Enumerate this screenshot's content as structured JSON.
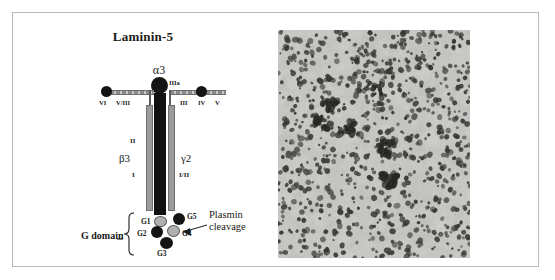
{
  "figure": {
    "panels": [
      "laminin-5-schematic",
      "tissue-micrograph"
    ]
  },
  "diagram": {
    "title": "Laminin-5",
    "alpha_chain": {
      "label": "α3",
      "domain_label": "IIIa"
    },
    "left_arm": {
      "domains": [
        "VI",
        "V/III"
      ]
    },
    "right_arm": {
      "domains": [
        "III",
        "IV",
        "V"
      ]
    },
    "beta_chain": {
      "label": "β3",
      "domains": [
        "II",
        "I"
      ]
    },
    "gamma_chain": {
      "label": "γ2",
      "domains": [
        "I/II"
      ]
    },
    "g_domain": {
      "label": "G domain",
      "globules": [
        {
          "name": "G1",
          "color": "#b0b0b0"
        },
        {
          "name": "G2",
          "color": "#141414"
        },
        {
          "name": "G3",
          "color": "#141414"
        },
        {
          "name": "G4",
          "color": "#b0b0b0"
        },
        {
          "name": "G5",
          "color": "#141414"
        }
      ]
    },
    "annotation": {
      "line1": "Plasmin",
      "line2": "cleavage"
    }
  },
  "micrograph": {
    "background_color": "#c6c6c2",
    "nuclei_color": "#3a3a38",
    "description": "tissue-section-nuclei-stain"
  }
}
